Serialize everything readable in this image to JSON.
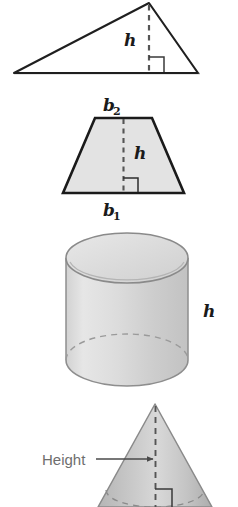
{
  "page": {
    "background_color": "#ffffff",
    "width": 238,
    "height": 507
  },
  "colors": {
    "outline_dark": "#1a1a1a",
    "outline_medium": "#555555",
    "outline_light": "#8a8a8a",
    "fill_light_gray": "#e3e3e3",
    "fill_mid_gray": "#cfcfcf",
    "fill_shade_gray": "#bdbdbd",
    "dashed_line": "#555555",
    "callout_gray": "#6e6e6e",
    "baseline_gray": "#9a9a9a"
  },
  "figures": [
    {
      "id": "triangle",
      "name": "triangle-figure",
      "shape": "triangle",
      "labels": [
        {
          "id": "triangle-height",
          "text": "h",
          "subscript": "",
          "style": "italic-serif"
        }
      ],
      "has_dashed_height": true,
      "has_right_angle_mark": true
    },
    {
      "id": "trapezoid",
      "name": "trapezoid-figure",
      "shape": "trapezoid",
      "labels": [
        {
          "id": "trapezoid-top-base",
          "text": "b",
          "subscript": "2",
          "style": "italic-serif"
        },
        {
          "id": "trapezoid-height",
          "text": "h",
          "subscript": "",
          "style": "italic-serif"
        },
        {
          "id": "trapezoid-bottom-base",
          "text": "b",
          "subscript": "1",
          "style": "italic-serif"
        }
      ],
      "has_dashed_height": true,
      "has_right_angle_mark": true
    },
    {
      "id": "cylinder",
      "name": "cylinder-figure",
      "shape": "cylinder",
      "labels": [
        {
          "id": "cylinder-height",
          "text": "h",
          "subscript": "",
          "style": "italic-serif"
        }
      ],
      "has_dashed_height": false,
      "has_right_angle_mark": false
    },
    {
      "id": "cone",
      "name": "cone-figure",
      "shape": "cone",
      "labels": [
        {
          "id": "cone-height-callout",
          "text": "Height",
          "subscript": "",
          "style": "sans-gray"
        }
      ],
      "has_dashed_height": true,
      "has_right_angle_mark": true,
      "has_callout_arrow": true
    }
  ],
  "labels": {
    "triangle_h": "h",
    "trapezoid_b2": "b",
    "trapezoid_b2_sub": "2",
    "trapezoid_h": "h",
    "trapezoid_b1": "b",
    "trapezoid_b1_sub": "1",
    "cylinder_h": "h",
    "cone_height": "Height"
  }
}
